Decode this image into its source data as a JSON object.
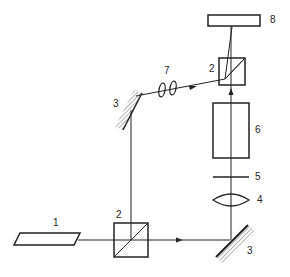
{
  "diagram": {
    "type": "optical-setup",
    "components": [
      {
        "id": "laser-source",
        "label": "1"
      },
      {
        "id": "beamsplitter-bottom",
        "label": "2"
      },
      {
        "id": "mirror-bottom-right",
        "label": "3"
      },
      {
        "id": "lens-focusing",
        "label": "4"
      },
      {
        "id": "filter-plate",
        "label": "5"
      },
      {
        "id": "sample-cell",
        "label": "6"
      },
      {
        "id": "beamsplitter-top",
        "label": "2"
      },
      {
        "id": "mirror-top-left",
        "label": "3"
      },
      {
        "id": "lens-pair",
        "label": "7"
      },
      {
        "id": "detector",
        "label": "8"
      }
    ]
  },
  "colors": {
    "line": "#222222",
    "hatch": "#555555",
    "background": "#ffffff"
  }
}
